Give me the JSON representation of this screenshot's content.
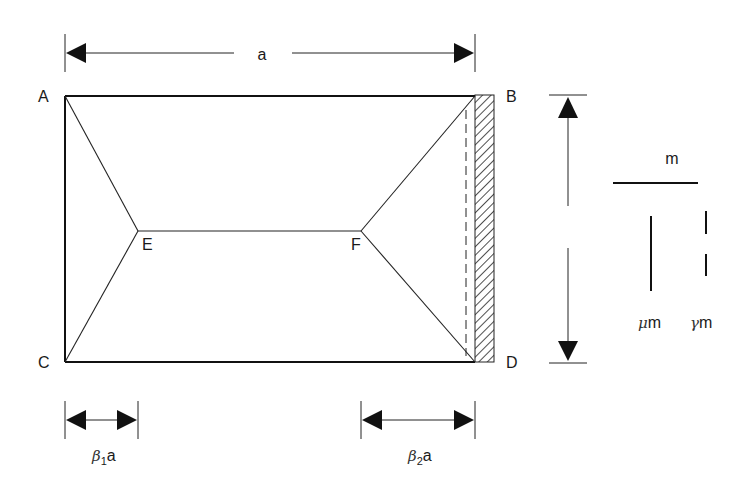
{
  "diagram": {
    "nodes": {
      "A": "A",
      "B": "B",
      "C": "C",
      "D": "D",
      "E": "E",
      "F": "F"
    },
    "dimensions": {
      "width": "a",
      "left_offset_greek": "β",
      "left_offset_sub": "1",
      "left_offset_suffix": "a",
      "right_offset_greek": "β",
      "right_offset_sub": "2",
      "right_offset_suffix": "a"
    },
    "legend": {
      "positive_moment": "m",
      "mu_greek": "μ",
      "mu_suffix": "m",
      "gamma_greek": "γ",
      "gamma_suffix": "m"
    },
    "edges": {
      "AB": "simply supported",
      "AC": "simply supported",
      "CD": "simply supported",
      "BD": "clamped (hatched)"
    }
  }
}
